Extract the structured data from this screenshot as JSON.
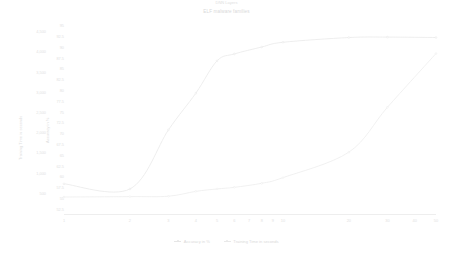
{
  "chart_data": {
    "type": "line",
    "title": "ELF malware families",
    "xlabel": "DNN Layers",
    "ylabel": "Training Time in seconds",
    "y2label": "Accuracy in %",
    "x_scale": "log",
    "x_ticks": [
      1,
      2,
      3,
      4,
      5,
      6,
      7,
      8,
      9,
      10,
      20,
      30,
      40,
      50
    ],
    "x_tick_labels": [
      "1",
      "2",
      "3",
      "4",
      "5",
      "6",
      "7",
      "8",
      "9",
      "10",
      "20",
      "30",
      "40",
      "50"
    ],
    "xlim": [
      1,
      50
    ],
    "y_ticks": [
      500,
      1000,
      1500,
      2000,
      2500,
      3000,
      3500,
      4000,
      4500
    ],
    "y_tick_labels": [
      "500",
      "1,000",
      "1,500",
      "2,000",
      "2,500",
      "3,000",
      "3,500",
      "4,000",
      "4,500"
    ],
    "ylim": [
      0,
      4750
    ],
    "y2_ticks": [
      52.5,
      55,
      57.5,
      60,
      62.5,
      65,
      67.5,
      70,
      72.5,
      75,
      77.5,
      80,
      82.5,
      85,
      87.5,
      90,
      92.5,
      95
    ],
    "y2_tick_labels": [
      "52.5",
      "55",
      "57.5",
      "60",
      "62.5",
      "65",
      "67.5",
      "70",
      "72.5",
      "75",
      "77.5",
      "80",
      "82.5",
      "85",
      "87.5",
      "90",
      "92.5",
      "95"
    ],
    "y2lim": [
      51.5,
      96
    ],
    "grid": false,
    "legend_position": "bottom",
    "series": [
      {
        "name": "Accuracy in %",
        "axis": "y2",
        "color": "#e8e8e8",
        "x": [
          1,
          2,
          3,
          4,
          5,
          6,
          8,
          10,
          20,
          30,
          50
        ],
        "values": [
          58.5,
          57.3,
          71.0,
          79.5,
          87.0,
          88.6,
          90.2,
          91.3,
          92.4,
          92.5,
          92.4
        ]
      },
      {
        "name": "Training Time in seconds",
        "axis": "y1",
        "color": "#ececec",
        "x": [
          1,
          2,
          3,
          4,
          5,
          6,
          8,
          10,
          20,
          30,
          50
        ],
        "values": [
          420,
          430,
          440,
          560,
          620,
          660,
          760,
          900,
          1530,
          2640,
          3970
        ]
      }
    ]
  },
  "legend": {
    "items": [
      {
        "label": "Accuracy in %",
        "color": "#e6e6e6"
      },
      {
        "label": "Training Time in seconds",
        "color": "#e9e9e9"
      }
    ]
  }
}
